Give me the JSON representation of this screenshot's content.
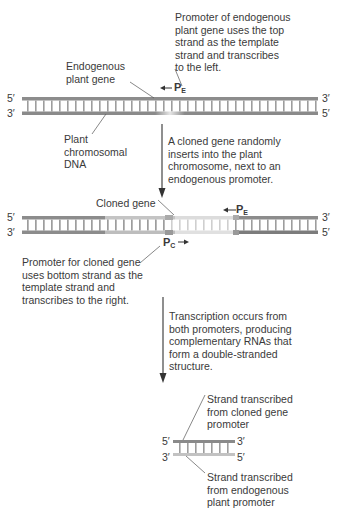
{
  "step1": {
    "promoter_note": "Promoter of endogenous\nplant gene uses the top\nstrand as the template\nstrand and transcribes\nto the left.",
    "gene_label": "Endogenous\nplant gene",
    "dna_label": "Plant\nchromosomal\nDNA",
    "promoter_label": "P",
    "promoter_sub": "E",
    "end_top_left": "5′",
    "end_top_right": "3′",
    "end_bottom_left": "3′",
    "end_bottom_right": "5′"
  },
  "arrow1_note": "A cloned gene randomly\ninserts into the plant\nchromosome, next to an\nendogenous promoter.",
  "step2": {
    "cloned_label": "Cloned gene",
    "pe_label": "P",
    "pe_sub": "E",
    "pc_label": "P",
    "pc_sub": "C",
    "pc_note": "Promoter for cloned gene\nuses bottom strand as the\ntemplate strand and\ntranscribes to the right.",
    "end_top_left": "5′",
    "end_top_right": "3′",
    "end_bottom_left": "3′",
    "end_bottom_right": "5′"
  },
  "arrow2_note": "Transcription occurs from\nboth promoters, producing\ncomplementary RNAs that\nform a double-stranded\nstructure.",
  "step3": {
    "top_note": "Strand transcribed\nfrom cloned gene\npromoter",
    "bottom_note": "Strand transcribed\nfrom endogenous\nplant promoter",
    "end_top_left": "5′",
    "end_top_right": "3′",
    "end_bottom_left": "3′",
    "end_bottom_right": "5′"
  },
  "colors": {
    "strand": "#8a8a8a",
    "rung": "#a5a5a5",
    "light": "#d8d8d8",
    "text": "#3a3a3a"
  }
}
